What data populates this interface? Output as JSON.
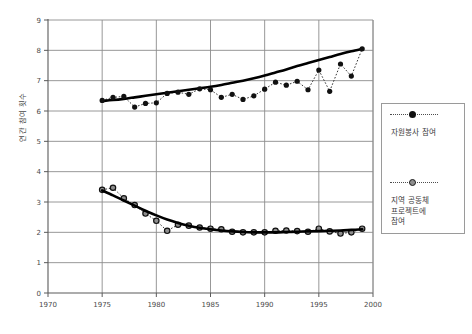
{
  "chart_data": {
    "type": "line",
    "title": "",
    "xlabel": "",
    "ylabel": "연간 참여 횟수",
    "xlim": [
      1970,
      2000
    ],
    "ylim": [
      0,
      9
    ],
    "xticks": [
      1970,
      1975,
      1980,
      1985,
      1990,
      1995,
      2000
    ],
    "yticks": [
      0,
      1,
      2,
      3,
      4,
      5,
      6,
      7,
      8,
      9
    ],
    "grid": true,
    "legend_position": "right",
    "marker_style_note": "filled-circle markers, dotted connecting lines, solid smoothed trend curve per series",
    "x": [
      1975,
      1976,
      1977,
      1978,
      1979,
      1980,
      1981,
      1982,
      1983,
      1984,
      1985,
      1986,
      1987,
      1988,
      1989,
      1990,
      1991,
      1992,
      1993,
      1994,
      1995,
      1996,
      1997,
      1998,
      1999
    ],
    "series": [
      {
        "name": "자원봉사 참여",
        "marker": "filled-circle",
        "values": [
          6.35,
          6.45,
          6.48,
          6.13,
          6.25,
          6.27,
          6.58,
          6.62,
          6.55,
          6.73,
          6.7,
          6.45,
          6.55,
          6.38,
          6.5,
          6.72,
          6.95,
          6.85,
          6.98,
          6.7,
          7.35,
          6.65,
          7.55,
          7.15,
          8.05
        ],
        "trend": [
          6.33,
          6.36,
          6.4,
          6.45,
          6.5,
          6.55,
          6.6,
          6.65,
          6.7,
          6.75,
          6.8,
          6.86,
          6.93,
          7.0,
          7.08,
          7.17,
          7.27,
          7.37,
          7.48,
          7.58,
          7.68,
          7.78,
          7.88,
          7.97,
          8.05
        ]
      },
      {
        "name": "지역 공동체 프로젝트에 참여",
        "marker": "hollow-circle",
        "values": [
          3.4,
          3.47,
          3.12,
          2.9,
          2.62,
          2.38,
          2.05,
          2.25,
          2.22,
          2.16,
          2.12,
          2.1,
          2.02,
          2.0,
          2.0,
          2.0,
          2.05,
          2.06,
          2.04,
          2.02,
          2.12,
          2.03,
          1.96,
          2.0,
          2.12
        ]
      },
      {
        "name": "지역 공동체 프로젝트에 참여 (추세)",
        "marker": "none",
        "trend": [
          3.38,
          3.22,
          3.05,
          2.88,
          2.71,
          2.56,
          2.42,
          2.31,
          2.22,
          2.15,
          2.1,
          2.06,
          2.03,
          2.01,
          2.0,
          2.0,
          2.0,
          2.01,
          2.02,
          2.03,
          2.04,
          2.05,
          2.06,
          2.08,
          2.1
        ]
      }
    ],
    "legend": [
      {
        "label": "자원봉사 참여",
        "marker": "filled-circle"
      },
      {
        "label_lines": [
          "지역 공동체",
          "프로젝트에",
          "참여"
        ],
        "marker": "hollow-circle"
      }
    ]
  },
  "colors": {
    "background": "#ffffff",
    "axis": "#5a5a5a",
    "grid": "#8c8c8c",
    "series_dark": "#111111",
    "series_hollow_fill": "#8d8d8d",
    "trend": "#000000",
    "text": "#4a4a4a",
    "legend_border": "#9a9a9a"
  }
}
